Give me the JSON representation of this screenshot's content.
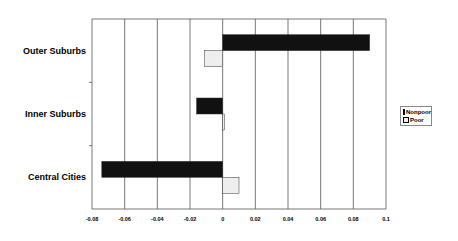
{
  "chart_data": {
    "type": "bar",
    "orientation": "horizontal",
    "title": "",
    "xlabel": "",
    "ylabel": "",
    "categories": [
      "Outer Suburbs",
      "Inner Suburbs",
      "Central Cities"
    ],
    "series": [
      {
        "name": "Nonpoor",
        "color": "#111111",
        "values": [
          0.09,
          -0.016,
          -0.074
        ]
      },
      {
        "name": "Poor",
        "color": "#eeeeee",
        "values": [
          -0.011,
          0.001,
          0.01
        ]
      }
    ],
    "xlim": [
      -0.08,
      0.1
    ],
    "xticks": [
      "-0.08",
      "-0.06",
      "-0.04",
      "-0.02",
      "0",
      "0.02",
      "0.04",
      "0.06",
      "0.08",
      "0.1"
    ],
    "grid": "vertical",
    "legend_position": "right"
  },
  "legend": {
    "items": [
      {
        "label": "Nonpoor"
      },
      {
        "label": "Poor"
      }
    ]
  }
}
